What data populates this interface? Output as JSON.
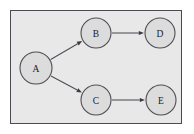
{
  "figure": {
    "kind": "directed-graph",
    "background_color": "#ffffff",
    "panel": {
      "fill_color": "#e8e8e8",
      "border_color": "#4a4a52",
      "x": 10,
      "y": 10,
      "width": 172,
      "height": 114
    }
  },
  "graph": {
    "node_fill_color": "#dcdcdc",
    "node_stroke_color": "#4d4d55",
    "edge_color": "#4d4d55",
    "label_color": "#1a1a1a",
    "nodes": [
      {
        "id": "A",
        "label": "A",
        "cx": 36,
        "cy": 68,
        "r": 16
      },
      {
        "id": "B",
        "label": "B",
        "cx": 96,
        "cy": 33,
        "r": 15
      },
      {
        "id": "C",
        "label": "C",
        "cx": 96,
        "cy": 100,
        "r": 15
      },
      {
        "id": "D",
        "label": "D",
        "cx": 160,
        "cy": 33,
        "r": 15
      },
      {
        "id": "E",
        "label": "E",
        "cx": 161,
        "cy": 100,
        "r": 15
      }
    ],
    "edges": [
      {
        "from": "A",
        "to": "B",
        "directed": true
      },
      {
        "from": "A",
        "to": "C",
        "directed": true
      },
      {
        "from": "B",
        "to": "D",
        "directed": true
      },
      {
        "from": "C",
        "to": "E",
        "directed": true
      }
    ]
  }
}
